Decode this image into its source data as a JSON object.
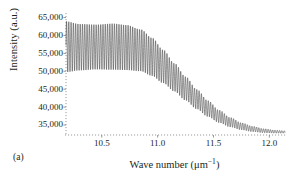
{
  "figure": {
    "panel_label": "(a)",
    "background": "#ffffff",
    "ink": "#231f20"
  },
  "chart_data": {
    "type": "line",
    "title": "",
    "subtitle": "",
    "xlabel": "Wave number (μm⁻¹)",
    "ylabel": "Intensity (a.u.)",
    "xlabel_parts": {
      "text": "Wave number (μm",
      "sup": "−1",
      "tail": ")"
    },
    "xlim": [
      10.18,
      12.14
    ],
    "ylim": [
      32200,
      66000
    ],
    "grid": false,
    "legend": null,
    "legend_position": "none",
    "line_color": "#3a3a3a",
    "line_width": 0.55,
    "xticks": [
      10.5,
      11.0,
      11.5,
      12.0
    ],
    "xticklabels": [
      "10.5",
      "11.0",
      "11.5",
      "12.0"
    ],
    "yticks": [
      35000,
      40000,
      45000,
      50000,
      55000,
      60000,
      65000
    ],
    "yticklabels": [
      "35,000",
      "40,000",
      "45,000",
      "50,000",
      "55,000",
      "60,000",
      "65,000"
    ],
    "fringe_period": 0.0205,
    "envelope_upper": {
      "x": [
        10.18,
        10.3,
        10.45,
        10.6,
        10.72,
        10.85,
        10.95,
        11.05,
        11.15,
        11.25,
        11.35,
        11.45,
        11.55,
        11.65,
        11.75,
        11.85,
        11.95,
        12.05,
        12.14
      ],
      "y": [
        64600,
        63800,
        63600,
        63900,
        63500,
        62200,
        59800,
        56400,
        52600,
        48800,
        45200,
        42000,
        39300,
        37200,
        35700,
        34700,
        34000,
        33600,
        33400
      ]
    },
    "envelope_lower": {
      "x": [
        10.18,
        10.3,
        10.45,
        10.6,
        10.72,
        10.85,
        10.95,
        11.05,
        11.15,
        11.25,
        11.35,
        11.45,
        11.55,
        11.65,
        11.75,
        11.85,
        11.95,
        12.05,
        12.14
      ],
      "y": [
        49600,
        50100,
        50400,
        50300,
        50200,
        49900,
        48600,
        46600,
        44300,
        41800,
        39400,
        37300,
        35600,
        34400,
        33600,
        33100,
        32800,
        32700,
        32700
      ]
    }
  }
}
